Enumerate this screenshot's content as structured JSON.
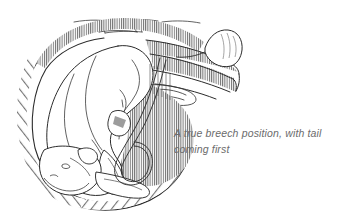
{
  "figure": {
    "kind": "line-drawing-illustration",
    "caption": "A true breech position, with tail\ncoming first",
    "caption_line_1": "A true breech position, with tail",
    "caption_line_2": "coming first",
    "parts": [
      {
        "name": "abdominal-wall",
        "label": "abdominal wall"
      },
      {
        "name": "uterus-outline",
        "label": "uterus"
      },
      {
        "name": "uterine-wall-hatching",
        "label": "hatched uterine wall"
      },
      {
        "name": "cervix-birth-canal",
        "label": "cervix / birth canal"
      },
      {
        "name": "fetus-body",
        "label": "fetus"
      },
      {
        "name": "fetus-head",
        "label": "fetal head"
      },
      {
        "name": "fetus-tail",
        "label": "tail presenting first"
      },
      {
        "name": "fetus-hind-legs",
        "label": "hind legs folded forward"
      },
      {
        "name": "umbilical-cord",
        "label": "umbilical cord"
      }
    ]
  },
  "colors": {
    "background": "#ffffff",
    "ink": "#2b2b2b",
    "hatching": "#4a4a4a",
    "caption_text": "#6b6b6b"
  }
}
